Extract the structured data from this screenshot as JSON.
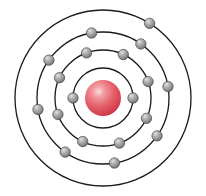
{
  "diagram": {
    "type": "bohr-atomic-model",
    "element_name": "Potassium",
    "element_symbol": "K",
    "atomic_number": 19,
    "electron_configuration": "2, 8, 8, 1",
    "background_color": "#ffffff",
    "center": {
      "x": 103,
      "y": 98
    }
  },
  "nucleus": {
    "label": "nucleus",
    "radius": 18,
    "color": "#e0555f",
    "highlight_color": "#f8c2c6",
    "shadow_color": "#b32d38",
    "center_x": 103,
    "center_y": 98
  },
  "electron_style": {
    "radius": 5.2,
    "color": "#8f8f8f",
    "highlight_color": "#d8d8d8",
    "shadow_color": "#5d5d5d",
    "outline_color": "#4a4a4a"
  },
  "orbit_style": {
    "stroke_color": "#1a1a1a",
    "stroke_width": 1.3
  },
  "shells": [
    {
      "index": 1,
      "name": "K-shell",
      "radius": 30,
      "electron_count": 2,
      "electron_angles": [
        180,
        0
      ]
    },
    {
      "index": 2,
      "name": "L-shell",
      "radius": 48,
      "electron_count": 8,
      "electron_angles": [
        200,
        155,
        110,
        65,
        20,
        335,
        290,
        245
      ]
    },
    {
      "index": 3,
      "name": "M-shell",
      "radius": 66,
      "electron_count": 8,
      "electron_angles": [
        190,
        145,
        100,
        55,
        10,
        325,
        280,
        235
      ]
    },
    {
      "index": 4,
      "name": "N-shell",
      "radius": 88,
      "electron_count": 1,
      "electron_angles": [
        58
      ]
    }
  ],
  "chart_data": {
    "type": "bar",
    "categories": [
      "K-shell",
      "L-shell",
      "M-shell",
      "N-shell"
    ],
    "values": [
      2,
      8,
      8,
      1
    ],
    "xlabel": "Shell",
    "ylabel": "Electron count",
    "ylim": [
      0,
      8
    ]
  }
}
